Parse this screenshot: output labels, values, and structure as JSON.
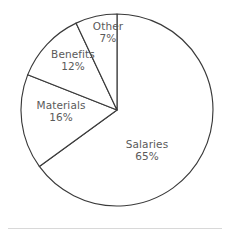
{
  "chart_data": {
    "type": "pie",
    "title": "",
    "subtitle": "",
    "xlabel": "",
    "ylabel": "",
    "legend_position": "none",
    "grid": false,
    "label_format": "name + percent",
    "start_angle_deg": 0,
    "direction": "clockwise",
    "categories": [
      "Salaries",
      "Materials",
      "Benefits",
      "Other"
    ],
    "values": [
      65,
      16,
      12,
      7
    ],
    "unit": "%",
    "slices": [
      {
        "name": "Salaries",
        "value": 65,
        "value_label": "65%",
        "color": "#ffffff",
        "outline": "#3a3a3a"
      },
      {
        "name": "Materials",
        "value": 16,
        "value_label": "16%",
        "color": "#ffffff",
        "outline": "#3a3a3a"
      },
      {
        "name": "Benefits",
        "value": 12,
        "value_label": "12%",
        "color": "#ffffff",
        "outline": "#3a3a3a"
      },
      {
        "name": "Other",
        "value": 7,
        "value_label": "7%",
        "color": "#ffffff",
        "outline": "#3a3a3a"
      }
    ]
  },
  "labels": {
    "other": {
      "name": "Other",
      "value": "7%"
    },
    "benefits": {
      "name": "Benefits",
      "value": "12%"
    },
    "materials": {
      "name": "Materials",
      "value": "16%"
    },
    "salaries": {
      "name": "Salaries",
      "value": "65%"
    }
  },
  "style": {
    "background": "#ffffff",
    "outline_color": "#3a3a3a",
    "text_color": "#5a5a5a",
    "divider_color": "#d8d8d8"
  }
}
